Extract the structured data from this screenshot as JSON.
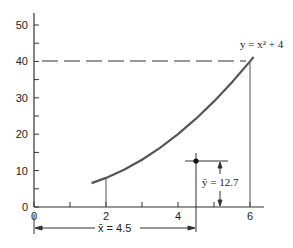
{
  "chart_data": {
    "type": "line",
    "title": "",
    "xlabel": "",
    "ylabel": "",
    "xlim": [
      0,
      6.6
    ],
    "ylim": [
      0,
      53
    ],
    "grid": false,
    "x_ticks": [
      0,
      2,
      4,
      6
    ],
    "x_tick_labels": [
      "0",
      "2",
      "4",
      "6"
    ],
    "x_minor_ticks": [
      1,
      3,
      5
    ],
    "y_ticks": [
      0,
      10,
      20,
      30,
      40,
      50
    ],
    "y_tick_labels": [
      "0",
      "10",
      "20",
      "30",
      "40",
      "50"
    ],
    "y_minor_ticks": [
      5,
      15,
      25,
      35,
      45
    ],
    "series": [
      {
        "name": "y = x^2 + 4",
        "equation": "y = x² + 4",
        "x": [
          1.6,
          2,
          2.5,
          3,
          3.5,
          4,
          4.5,
          5,
          5.5,
          6,
          6.1
        ],
        "y": [
          6.56,
          8,
          10.25,
          13,
          16.25,
          20,
          24.25,
          29,
          34.25,
          40,
          41.2
        ]
      }
    ],
    "annotations": {
      "curve_label": "y = x² + 4",
      "centroid": {
        "x": 4.5,
        "y": 12.7
      },
      "xbar_label": "x̄ = 4.5",
      "ybar_label": "ȳ = 12.7",
      "dashed_reference_y": 40,
      "vertical_bounds_x": [
        2,
        6
      ]
    }
  }
}
